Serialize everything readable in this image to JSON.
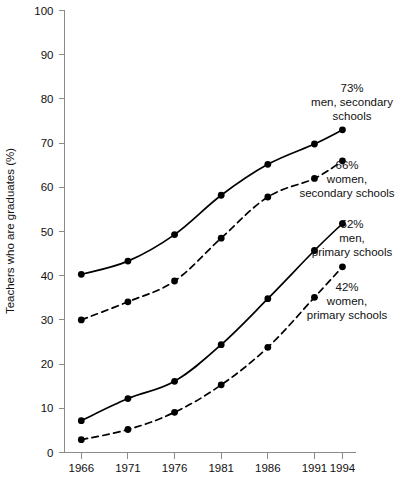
{
  "chart_data": {
    "type": "line",
    "title": "",
    "xlabel": "",
    "ylabel": "Teachers who are graduates (%)",
    "x": [
      1966,
      1971,
      1976,
      1981,
      1986,
      1991,
      1994
    ],
    "xticklabels": [
      "1966",
      "1971",
      "1976",
      "1981",
      "1986",
      "1991",
      "1994"
    ],
    "yticklabels": [
      "0",
      "10",
      "20",
      "30",
      "40",
      "50",
      "60",
      "70",
      "80",
      "90",
      "100"
    ],
    "yticks": [
      0,
      10,
      20,
      30,
      40,
      50,
      60,
      70,
      80,
      90,
      100
    ],
    "ylim": [
      0,
      100
    ],
    "xlim": [
      1964.2,
      1995.4
    ],
    "grid": false,
    "legend": "annotations at right end of each series",
    "series": [
      {
        "name": "men, secondary schools",
        "style": "solid",
        "marker": "filled-circle",
        "values": [
          40.3,
          43.3,
          49.3,
          58.2,
          65.2,
          69.8,
          73.0
        ],
        "end_label_value": "73%",
        "end_label_line1": "men, secondary",
        "end_label_line2": "schools"
      },
      {
        "name": "women, secondary schools",
        "style": "dashed",
        "marker": "filled-circle",
        "values": [
          30.0,
          34.1,
          38.8,
          48.5,
          57.8,
          62.0,
          66.0
        ],
        "end_label_value": "66%",
        "end_label_line1": "women,",
        "end_label_line2": "secondary schools"
      },
      {
        "name": "men, primary schools",
        "style": "solid",
        "marker": "filled-circle",
        "values": [
          7.2,
          12.2,
          16.1,
          24.4,
          34.8,
          45.7,
          51.8
        ],
        "end_label_value": "52%",
        "end_label_line1": "men,",
        "end_label_line2": "primary schools"
      },
      {
        "name": "women, primary schools",
        "style": "dashed",
        "marker": "filled-circle",
        "values": [
          2.9,
          5.2,
          9.1,
          15.3,
          23.8,
          35.1,
          42.0
        ],
        "end_label_value": "42%",
        "end_label_line1": "women,",
        "end_label_line2": "primary schools"
      }
    ],
    "annotations": [
      {
        "value": "73%",
        "line1": "men, secondary",
        "line2": "schools",
        "x": 352,
        "y": 92
      },
      {
        "value": "66%",
        "line1": "women,",
        "line2": "secondary schools",
        "x": 347,
        "y": 169
      },
      {
        "value": "52%",
        "line1": "men,",
        "line2": "primary schools",
        "x": 352,
        "y": 228
      },
      {
        "value": "42%",
        "line1": "women,",
        "line2": "primary schools",
        "x": 347,
        "y": 291
      }
    ],
    "colors": {
      "line": "#000000",
      "marker": "#000000",
      "axis": "#8a8a8a",
      "text": "#111111",
      "background": "#ffffff"
    }
  }
}
